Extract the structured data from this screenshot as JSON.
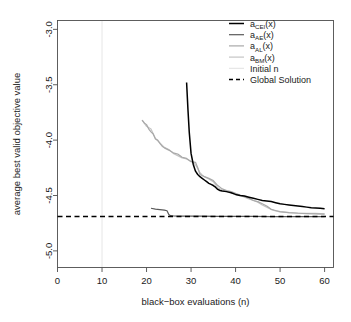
{
  "chart_data": {
    "type": "line",
    "title": "",
    "xlabel": "black−box evaluations (n)",
    "ylabel": "average best valid objective value",
    "xlim": [
      0,
      62
    ],
    "ylim": [
      -5.15,
      -2.92
    ],
    "xticks": [
      0,
      10,
      20,
      30,
      40,
      50,
      60
    ],
    "xtick_labels": [
      "0",
      "10",
      "20",
      "30",
      "40",
      "50",
      "60"
    ],
    "yticks": [
      -3.0,
      -3.5,
      -4.0,
      -4.5,
      -5.0
    ],
    "ytick_labels": [
      "-3.0",
      "-3.5",
      "-4.0",
      "-4.5",
      "-5.0"
    ],
    "grid": false,
    "legend_position": "top-right",
    "legend": [
      {
        "label": "a_CEI(x)",
        "base": "a",
        "sub": "CEI",
        "suffix": "(x)",
        "color": "#000000",
        "style": "solid",
        "width": 1.5
      },
      {
        "label": "a_AE(x)",
        "base": "a",
        "sub": "AE",
        "suffix": "(x)",
        "color": "#5a5a5a",
        "style": "solid",
        "width": 1.2
      },
      {
        "label": "a_AL(x)",
        "base": "a",
        "sub": "AL",
        "suffix": "(x)",
        "color": "#a8a8a8",
        "style": "solid",
        "width": 1.2
      },
      {
        "label": "a_BM(x)",
        "base": "a",
        "sub": "BM",
        "suffix": "(x)",
        "color": "#c4c4c4",
        "style": "solid",
        "width": 1.2
      },
      {
        "label": "Initial n",
        "base": "Initial n",
        "sub": "",
        "suffix": "",
        "color": "#e2e2e2",
        "style": "solid",
        "width": 1.0
      },
      {
        "label": "Global Solution",
        "base": "Global Solution",
        "sub": "",
        "suffix": "",
        "color": "#000000",
        "style": "dashed",
        "width": 1.6
      }
    ],
    "annotations": [
      {
        "name": "initial-n-vline",
        "type": "vline",
        "x": 10,
        "color": "#e6e6e6"
      },
      {
        "name": "global-solution-hline",
        "type": "hline",
        "y": -4.69,
        "color": "#000000",
        "style": "dashed"
      }
    ],
    "series": [
      {
        "name": "a_CEI(x)",
        "color": "#000000",
        "width": 1.5,
        "x": [
          29,
          29.3,
          29.6,
          30,
          30.5,
          31,
          31.5,
          32,
          32.5,
          33,
          33.5,
          34,
          34.5,
          35,
          35.5,
          36,
          36.5,
          37,
          38,
          39,
          40,
          41,
          42,
          43,
          44,
          45,
          46,
          47,
          48,
          49,
          50,
          51,
          52,
          53,
          54,
          55,
          56,
          57,
          58,
          59,
          60
        ],
        "y": [
          -3.48,
          -3.72,
          -3.93,
          -4.12,
          -4.22,
          -4.28,
          -4.31,
          -4.33,
          -4.345,
          -4.36,
          -4.375,
          -4.39,
          -4.4,
          -4.41,
          -4.425,
          -4.445,
          -4.455,
          -4.46,
          -4.465,
          -4.475,
          -4.49,
          -4.5,
          -4.505,
          -4.515,
          -4.525,
          -4.535,
          -4.545,
          -4.55,
          -4.555,
          -4.565,
          -4.575,
          -4.58,
          -4.585,
          -4.59,
          -4.595,
          -4.6,
          -4.605,
          -4.61,
          -4.612,
          -4.615,
          -4.62
        ]
      },
      {
        "name": "a_AE(x)",
        "color": "#5a5a5a",
        "width": 1.2,
        "x": [
          21,
          22,
          23,
          24,
          24.6,
          25,
          25.4,
          26,
          28,
          32,
          36,
          40,
          44,
          48,
          52,
          56,
          60
        ],
        "y": [
          -4.615,
          -4.623,
          -4.627,
          -4.632,
          -4.638,
          -4.672,
          -4.682,
          -4.684,
          -4.686,
          -4.687,
          -4.688,
          -4.689,
          -4.689,
          -4.69,
          -4.69,
          -4.69,
          -4.69
        ]
      },
      {
        "name": "a_AL(x)",
        "color": "#a8a8a8",
        "width": 1.2,
        "x": [
          19,
          19.5,
          20,
          20.5,
          21,
          21.5,
          22,
          22.5,
          23,
          23.5,
          24,
          25,
          26,
          27,
          28,
          29,
          30,
          31,
          31.5,
          32,
          33,
          34,
          35,
          36,
          37,
          38,
          39,
          40,
          41,
          42,
          43,
          44,
          45,
          46,
          47,
          48,
          49,
          50,
          52,
          54,
          56,
          58,
          60
        ],
        "y": [
          -3.82,
          -3.845,
          -3.86,
          -3.9,
          -3.925,
          -3.945,
          -3.99,
          -4.0,
          -4.03,
          -4.055,
          -4.07,
          -4.09,
          -4.115,
          -4.125,
          -4.155,
          -4.165,
          -4.195,
          -4.2,
          -4.25,
          -4.31,
          -4.33,
          -4.345,
          -4.365,
          -4.41,
          -4.44,
          -4.455,
          -4.465,
          -4.48,
          -4.495,
          -4.51,
          -4.525,
          -4.545,
          -4.555,
          -4.575,
          -4.595,
          -4.625,
          -4.635,
          -4.645,
          -4.655,
          -4.66,
          -4.663,
          -4.665,
          -4.668
        ]
      },
      {
        "name": "a_BM(x)",
        "color": "#c4c4c4",
        "width": 1.2,
        "x": [
          19,
          20,
          21,
          22,
          23,
          24,
          25,
          26,
          27,
          28,
          29,
          30,
          30.5,
          31,
          31.5,
          32,
          32.5,
          33,
          34,
          35,
          36,
          37,
          38,
          39,
          40,
          41,
          42,
          43,
          44,
          45,
          46,
          47,
          48,
          49,
          50,
          52,
          54,
          56,
          58,
          60
        ],
        "y": [
          -3.82,
          -3.875,
          -3.9,
          -3.985,
          -4.025,
          -4.065,
          -4.085,
          -4.12,
          -4.14,
          -4.16,
          -4.17,
          -4.19,
          -4.2,
          -4.225,
          -4.255,
          -4.295,
          -4.315,
          -4.33,
          -4.35,
          -4.375,
          -4.43,
          -4.45,
          -4.465,
          -4.475,
          -4.49,
          -4.5,
          -4.515,
          -4.53,
          -4.545,
          -4.56,
          -4.585,
          -4.605,
          -4.625,
          -4.64,
          -4.648,
          -4.655,
          -4.658,
          -4.66,
          -4.662,
          -4.665
        ]
      }
    ]
  }
}
